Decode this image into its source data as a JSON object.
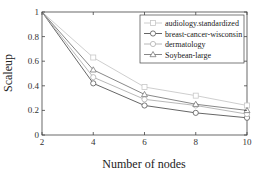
{
  "chart_data": {
    "type": "line",
    "title": "",
    "xlabel": "Number of nodes",
    "ylabel": "Scaleup",
    "x": [
      2,
      4,
      6,
      8,
      10
    ],
    "xlim": [
      2,
      10
    ],
    "ylim": [
      0,
      1
    ],
    "xticks": [
      "2",
      "4",
      "6",
      "8",
      "10"
    ],
    "yticks": [
      "0",
      "0.2",
      "0.4",
      "0.6",
      "0.8",
      "1"
    ],
    "grid": false,
    "legend_position": "upper right",
    "series": [
      {
        "name": "audiology.standardized",
        "marker": "square",
        "color": "#c8c8c8",
        "values": [
          1.0,
          0.63,
          0.39,
          0.32,
          0.24
        ]
      },
      {
        "name": "breast-cancer-wisconsin",
        "marker": "circle",
        "color": "#555555",
        "values": [
          1.0,
          0.42,
          0.24,
          0.18,
          0.14
        ]
      },
      {
        "name": "dermatology",
        "marker": "circle",
        "color": "#b0b0b0",
        "values": [
          1.0,
          0.47,
          0.29,
          0.24,
          0.17
        ]
      },
      {
        "name": "Soybean-large",
        "marker": "triangle",
        "color": "#7a7a7a",
        "values": [
          1.0,
          0.53,
          0.33,
          0.25,
          0.2
        ]
      }
    ]
  }
}
